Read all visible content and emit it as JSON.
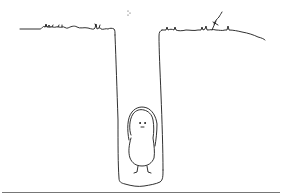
{
  "illustration": {
    "subject": "figure standing at the bottom of a deep hole",
    "colors": {
      "background": "#ffffff",
      "ink": "#1a1a1a",
      "rule": "#777777"
    }
  }
}
